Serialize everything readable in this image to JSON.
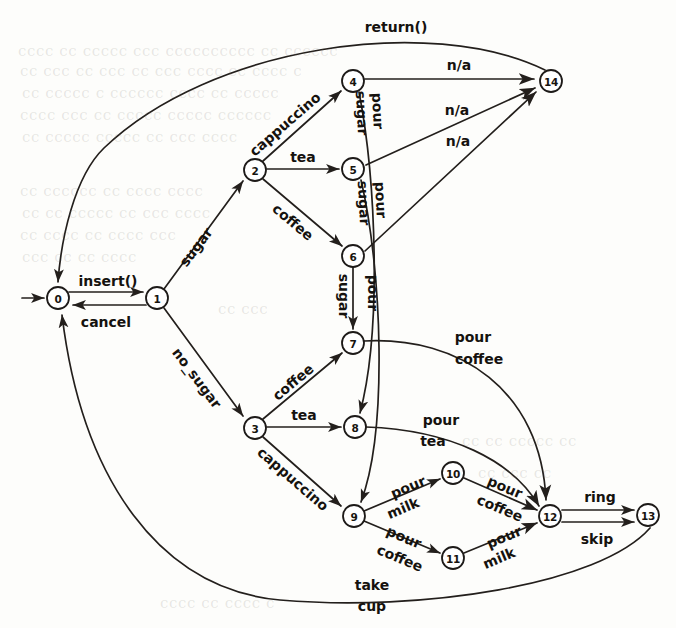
{
  "diagram": {
    "type": "state-transition-diagram",
    "colors": {
      "stroke": "#231f1c",
      "node_fill": "#ffffff",
      "text": "#15120e",
      "background": "#fdfdfb"
    },
    "nodes": [
      {
        "id": "0",
        "label": "0",
        "x": 58,
        "y": 298,
        "r": 11,
        "initial": true
      },
      {
        "id": "1",
        "label": "1",
        "x": 157,
        "y": 298,
        "r": 11
      },
      {
        "id": "2",
        "label": "2",
        "x": 255,
        "y": 170,
        "r": 11
      },
      {
        "id": "3",
        "label": "3",
        "x": 255,
        "y": 428,
        "r": 11
      },
      {
        "id": "4",
        "label": "4",
        "x": 353,
        "y": 81,
        "r": 11
      },
      {
        "id": "5",
        "label": "5",
        "x": 353,
        "y": 169,
        "r": 11
      },
      {
        "id": "6",
        "label": "6",
        "x": 353,
        "y": 256,
        "r": 11
      },
      {
        "id": "7",
        "label": "7",
        "x": 353,
        "y": 343,
        "r": 11
      },
      {
        "id": "8",
        "label": "8",
        "x": 355,
        "y": 427,
        "r": 11
      },
      {
        "id": "9",
        "label": "9",
        "x": 354,
        "y": 516,
        "r": 11
      },
      {
        "id": "10",
        "label": "10",
        "x": 453,
        "y": 473,
        "r": 11
      },
      {
        "id": "11",
        "label": "11",
        "x": 453,
        "y": 558,
        "r": 11
      },
      {
        "id": "12",
        "label": "12",
        "x": 550,
        "y": 516,
        "r": 11
      },
      {
        "id": "13",
        "label": "13",
        "x": 648,
        "y": 515,
        "r": 11
      },
      {
        "id": "14",
        "label": "14",
        "x": 551,
        "y": 81,
        "r": 11
      }
    ],
    "edges": [
      {
        "id": "start",
        "from": "",
        "to": "0",
        "label": "",
        "label_x": 0,
        "label_y": 0
      },
      {
        "id": "e0_1",
        "from": "0",
        "to": "1",
        "label": "insert()",
        "label_x": 108,
        "label_y": 283
      },
      {
        "id": "e1_0",
        "from": "1",
        "to": "0",
        "label": "cancel",
        "label_x": 106,
        "label_y": 320
      },
      {
        "id": "e1_2",
        "from": "1",
        "to": "2",
        "label": "sugar",
        "label_x": 196,
        "label_y": 247
      },
      {
        "id": "e1_3",
        "from": "1",
        "to": "3",
        "label": "no_sugar",
        "label_x": 196,
        "label_y": 378
      },
      {
        "id": "e2_4",
        "from": "2",
        "to": "4",
        "label": "cappuccino",
        "label_x": 283,
        "label_y": 125
      },
      {
        "id": "e2_5",
        "from": "2",
        "to": "5",
        "label": "tea",
        "label_x": 302,
        "label_y": 157
      },
      {
        "id": "e2_6",
        "from": "2",
        "to": "6",
        "label": "coffee",
        "label_x": 295,
        "label_y": 225
      },
      {
        "id": "e3_7",
        "from": "3",
        "to": "7",
        "label": "coffee",
        "label_x": 295,
        "label_y": 383
      },
      {
        "id": "e3_8",
        "from": "3",
        "to": "8",
        "label": "tea",
        "label_x": 303,
        "label_y": 415
      },
      {
        "id": "e3_9",
        "from": "3",
        "to": "9",
        "label": "cappuccino",
        "label_x": 291,
        "label_y": 479
      },
      {
        "id": "e4_14",
        "from": "4",
        "to": "14",
        "label": "n/a",
        "label_x": 459,
        "label_y": 65
      },
      {
        "id": "e5_14",
        "from": "5",
        "to": "14",
        "label": "n/a",
        "label_x": 457,
        "label_y": 110
      },
      {
        "id": "e6_14",
        "from": "6",
        "to": "14",
        "label": "n/a",
        "label_x": 458,
        "label_y": 140
      },
      {
        "id": "e4_8",
        "from": "4",
        "to": "8",
        "label": "pour sugar",
        "label_x": 370,
        "label_y": 118
      },
      {
        "id": "e5_9",
        "from": "5",
        "to": "9",
        "label": "pour sugar",
        "label_x": 372,
        "label_y": 206
      },
      {
        "id": "e6_7",
        "from": "6",
        "to": "7",
        "label": "pour sugar",
        "label_x": 371,
        "label_y": 295
      },
      {
        "id": "e7_12",
        "from": "7",
        "to": "12",
        "label": "pour coffee",
        "label_x": 473,
        "label_y": 346
      },
      {
        "id": "e8_12",
        "from": "8",
        "to": "12",
        "label": "pour tea",
        "label_x": 440,
        "label_y": 429
      },
      {
        "id": "e9_10",
        "from": "9",
        "to": "10",
        "label": "pour milk",
        "label_x": 405,
        "label_y": 492
      },
      {
        "id": "e9_11",
        "from": "9",
        "to": "11",
        "label": "pour coffee",
        "label_x": 404,
        "label_y": 543
      },
      {
        "id": "e10_12",
        "from": "10",
        "to": "12",
        "label": "pour coffee",
        "label_x": 502,
        "label_y": 492
      },
      {
        "id": "e11_12",
        "from": "11",
        "to": "12",
        "label": "pour milk",
        "label_x": 503,
        "label_y": 543
      },
      {
        "id": "e12_13",
        "from": "12",
        "to": "13",
        "label": "ring",
        "label_x": 600,
        "label_y": 498
      },
      {
        "id": "e13_12",
        "from": "13",
        "to": "12",
        "label": "skip",
        "label_x": 597,
        "label_y": 538
      },
      {
        "id": "e14_0",
        "from": "14",
        "to": "0",
        "label": "return()",
        "label_x": 396,
        "label_y": 27
      },
      {
        "id": "e13_0",
        "from": "13",
        "to": "0",
        "label": "take cup",
        "label_x": 372,
        "label_y": 586
      }
    ],
    "sublabels": {
      "pour_sugar_1": "pour",
      "pour_sugar_2": "sugar",
      "take": "take",
      "cup": "cup",
      "pour": "pour",
      "coffee": "coffee",
      "tea": "tea",
      "milk": "milk"
    },
    "edge_label_lines": {
      "e4_8": [
        "pour",
        "sugar"
      ],
      "e5_9": [
        "pour",
        "sugar"
      ],
      "e6_7": [
        "pour",
        "sugar"
      ],
      "e7_12": [
        "pour",
        "coffee"
      ],
      "e8_12": [
        "pour",
        "tea"
      ],
      "e9_10": [
        "pour",
        "milk"
      ],
      "e9_11": [
        "pour",
        "coffee"
      ],
      "e10_12": [
        "pour",
        "coffee"
      ],
      "e11_12": [
        "pour",
        "milk"
      ],
      "e13_0": [
        "take",
        "cup"
      ]
    },
    "text_labels": {
      "insert": "insert()",
      "cancel": "cancel",
      "sugar": "sugar",
      "no_sugar": "no_sugar",
      "cappuccino_top": "cappuccino",
      "tea_top": "tea",
      "coffee_top": "coffee",
      "coffee_bottom": "coffee",
      "tea_bottom": "tea",
      "cappuccino_bottom": "cappuccino",
      "na_1": "n/a",
      "na_2": "n/a",
      "na_3": "n/a",
      "return": "return()",
      "ring": "ring",
      "skip": "skip",
      "pour_a": "pour",
      "sugar_a": "sugar",
      "pour_b": "pour",
      "sugar_b": "sugar",
      "pour_c": "pour",
      "sugar_c": "sugar",
      "pour_d": "pour",
      "coffee_d": "coffee",
      "pour_e": "pour",
      "tea_e": "tea",
      "pour_f": "pour",
      "milk_f": "milk",
      "pour_g": "pour",
      "coffee_g": "coffee",
      "pour_h": "pour",
      "coffee_h": "coffee",
      "pour_i": "pour",
      "milk_i": "milk",
      "take": "take",
      "cup": "cup"
    },
    "background_text": [
      {
        "text": "cccc cc ccccc ccc cccccccccc cc cccccc",
        "x": 18,
        "y": 42,
        "size": 15
      },
      {
        "text": "cc ccc cc ccc cc ccc cccc cc cccc c",
        "x": 20,
        "y": 62,
        "size": 15
      },
      {
        "text": "cc ccccc c cccccc cccc cc ccccc",
        "x": 22,
        "y": 84,
        "size": 15
      },
      {
        "text": "cccc ccc cc ccccc ccccc cccccc",
        "x": 20,
        "y": 106,
        "size": 15
      },
      {
        "text": "cc ccccc ccccc cc ccc cccc",
        "x": 22,
        "y": 128,
        "size": 15
      },
      {
        "text": "cc cccccc cc cccc cccc",
        "x": 20,
        "y": 182,
        "size": 15
      },
      {
        "text": "cc cc ccccc cc ccc cccc",
        "x": 22,
        "y": 204,
        "size": 15
      },
      {
        "text": "cc cccc cc cccc ccc",
        "x": 20,
        "y": 226,
        "size": 15
      },
      {
        "text": "ccc cc cc cccc",
        "x": 22,
        "y": 248,
        "size": 15
      },
      {
        "text": "cc ccc",
        "x": 218,
        "y": 300,
        "size": 15
      },
      {
        "text": "cc cc ccccc cc",
        "x": 462,
        "y": 432,
        "size": 15
      },
      {
        "text": "cc ccc cc",
        "x": 478,
        "y": 464,
        "size": 15
      },
      {
        "text": "cccc cc cccc c",
        "x": 160,
        "y": 594,
        "size": 15
      }
    ]
  }
}
